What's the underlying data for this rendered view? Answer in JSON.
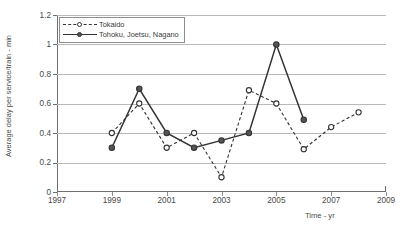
{
  "chart_data": {
    "type": "line",
    "title": "",
    "xlabel": "Time - yr",
    "ylabel": "Average delay per service/train - min",
    "xlim": [
      1997,
      2009
    ],
    "ylim": [
      0,
      1.2
    ],
    "grid": true,
    "legend_position": "top-left",
    "xticks": [
      "1997",
      "1999",
      "2001",
      "2003",
      "2005",
      "2007",
      "2009"
    ],
    "xtick_values": [
      1997,
      1999,
      2001,
      2003,
      2005,
      2007,
      2009
    ],
    "yticks": [
      "0",
      "0.2",
      "0.4",
      "0.6",
      "0.8",
      "1",
      "1.2"
    ],
    "ytick_values": [
      0,
      0.2,
      0.4,
      0.6,
      0.8,
      1,
      1.2
    ],
    "series": [
      {
        "name": "Tokaido",
        "style": "dashed",
        "marker": "open-circle",
        "color": "#333333",
        "x": [
          1999,
          2000,
          2001,
          2002,
          2003,
          2004,
          2005,
          2006,
          2007,
          2008
        ],
        "values": [
          0.4,
          0.6,
          0.3,
          0.4,
          0.1,
          0.69,
          0.6,
          0.29,
          0.44,
          0.54
        ]
      },
      {
        "name": "Tohoku, Joetsu, Nagano",
        "style": "solid",
        "marker": "filled-circle",
        "color": "#333333",
        "x": [
          1999,
          2000,
          2001,
          2002,
          2003,
          2004,
          2005,
          2006
        ],
        "values": [
          0.3,
          0.7,
          0.4,
          0.3,
          0.35,
          0.4,
          1.0,
          0.49
        ]
      }
    ]
  },
  "legend": {
    "items": [
      {
        "label": "Tokaido"
      },
      {
        "label": "Tohoku, Joetsu, Nagano"
      }
    ]
  },
  "axes": {
    "x_title": "Time - yr",
    "y_title": "Average delay per service/train - min"
  }
}
